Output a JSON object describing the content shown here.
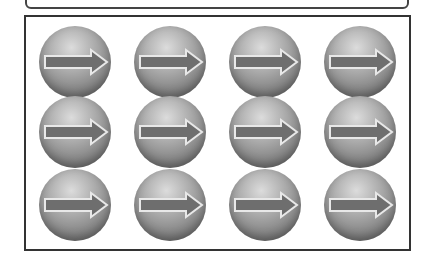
{
  "grid": {
    "rows": 3,
    "cols": 4,
    "items": [
      {
        "icon": "right-arrow-ball",
        "row": 0,
        "col": 0
      },
      {
        "icon": "right-arrow-ball",
        "row": 0,
        "col": 1
      },
      {
        "icon": "right-arrow-ball",
        "row": 0,
        "col": 2
      },
      {
        "icon": "right-arrow-ball",
        "row": 0,
        "col": 3
      },
      {
        "icon": "right-arrow-ball",
        "row": 1,
        "col": 0
      },
      {
        "icon": "right-arrow-ball",
        "row": 1,
        "col": 1
      },
      {
        "icon": "right-arrow-ball",
        "row": 1,
        "col": 2
      },
      {
        "icon": "right-arrow-ball",
        "row": 1,
        "col": 3
      },
      {
        "icon": "right-arrow-ball",
        "row": 2,
        "col": 0
      },
      {
        "icon": "right-arrow-ball",
        "row": 2,
        "col": 1
      },
      {
        "icon": "right-arrow-ball",
        "row": 2,
        "col": 2
      },
      {
        "icon": "right-arrow-ball",
        "row": 2,
        "col": 3
      }
    ]
  },
  "colors": {
    "ball_light": "#dcdcdc",
    "ball_dark": "#5e5e5e",
    "arrow_fill": "#6e6e6e",
    "arrow_outline": "#e8e8e8",
    "frame_border": "#333333"
  }
}
